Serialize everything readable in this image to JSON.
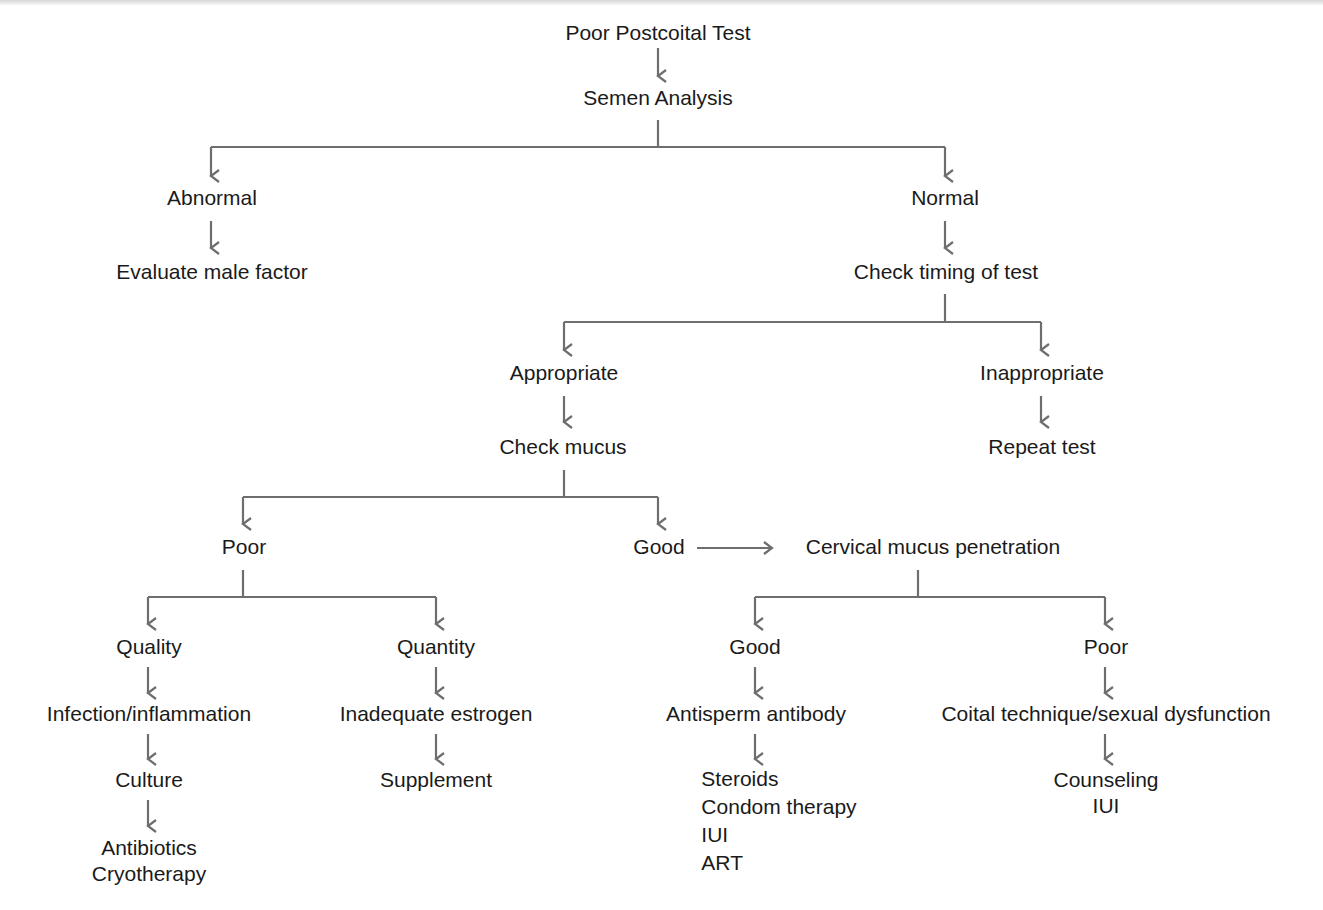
{
  "diagram": {
    "type": "flowchart",
    "title": "Poor Postcoital Test",
    "line_color": "#6e6e6e",
    "text_color": "#1a1a1a",
    "nodes": {
      "root": {
        "lines": [
          "Poor Postcoital Test"
        ]
      },
      "semen_analysis": {
        "lines": [
          "Semen Analysis"
        ]
      },
      "abnormal": {
        "lines": [
          "Abnormal"
        ]
      },
      "evaluate_male": {
        "lines": [
          "Evaluate male factor"
        ]
      },
      "normal": {
        "lines": [
          "Normal"
        ]
      },
      "check_timing": {
        "lines": [
          "Check timing of test"
        ]
      },
      "appropriate": {
        "lines": [
          "Appropriate"
        ]
      },
      "check_mucus": {
        "lines": [
          "Check mucus"
        ]
      },
      "inappropriate": {
        "lines": [
          "Inappropriate"
        ]
      },
      "repeat_test": {
        "lines": [
          "Repeat test"
        ]
      },
      "mucus_poor": {
        "lines": [
          "Poor"
        ]
      },
      "mucus_good": {
        "lines": [
          "Good"
        ]
      },
      "cmp": {
        "lines": [
          "Cervical mucus penetration"
        ]
      },
      "quality": {
        "lines": [
          "Quality"
        ]
      },
      "infection": {
        "lines": [
          "Infection/inflammation"
        ]
      },
      "culture": {
        "lines": [
          "Culture"
        ]
      },
      "antibiotics": {
        "lines": [
          "Antibiotics",
          "Cryotherapy"
        ]
      },
      "quantity": {
        "lines": [
          "Quantity"
        ]
      },
      "inadequate_estrogen": {
        "lines": [
          "Inadequate estrogen"
        ]
      },
      "supplement": {
        "lines": [
          "Supplement"
        ]
      },
      "cmp_good": {
        "lines": [
          "Good"
        ]
      },
      "antisperm": {
        "lines": [
          "Antisperm antibody"
        ]
      },
      "steroids": {
        "lines": [
          "Steroids",
          "Condom therapy",
          "IUI",
          "ART"
        ]
      },
      "cmp_poor": {
        "lines": [
          "Poor"
        ]
      },
      "coital": {
        "lines": [
          "Coital technique/sexual dysfunction"
        ]
      },
      "counseling": {
        "lines": [
          "Counseling",
          "IUI"
        ]
      }
    },
    "edges": [
      {
        "from": "root",
        "to": "semen_analysis"
      },
      {
        "from": "semen_analysis",
        "to": "abnormal"
      },
      {
        "from": "semen_analysis",
        "to": "normal"
      },
      {
        "from": "abnormal",
        "to": "evaluate_male"
      },
      {
        "from": "normal",
        "to": "check_timing"
      },
      {
        "from": "check_timing",
        "to": "appropriate"
      },
      {
        "from": "check_timing",
        "to": "inappropriate"
      },
      {
        "from": "appropriate",
        "to": "check_mucus"
      },
      {
        "from": "inappropriate",
        "to": "repeat_test"
      },
      {
        "from": "check_mucus",
        "to": "mucus_poor"
      },
      {
        "from": "check_mucus",
        "to": "mucus_good"
      },
      {
        "from": "mucus_good",
        "to": "cmp"
      },
      {
        "from": "mucus_poor",
        "to": "quality"
      },
      {
        "from": "mucus_poor",
        "to": "quantity"
      },
      {
        "from": "quality",
        "to": "infection"
      },
      {
        "from": "infection",
        "to": "culture"
      },
      {
        "from": "culture",
        "to": "antibiotics"
      },
      {
        "from": "quantity",
        "to": "inadequate_estrogen"
      },
      {
        "from": "inadequate_estrogen",
        "to": "supplement"
      },
      {
        "from": "cmp",
        "to": "cmp_good"
      },
      {
        "from": "cmp",
        "to": "cmp_poor"
      },
      {
        "from": "cmp_good",
        "to": "antisperm"
      },
      {
        "from": "antisperm",
        "to": "steroids"
      },
      {
        "from": "cmp_poor",
        "to": "coital"
      },
      {
        "from": "coital",
        "to": "counseling"
      }
    ]
  }
}
